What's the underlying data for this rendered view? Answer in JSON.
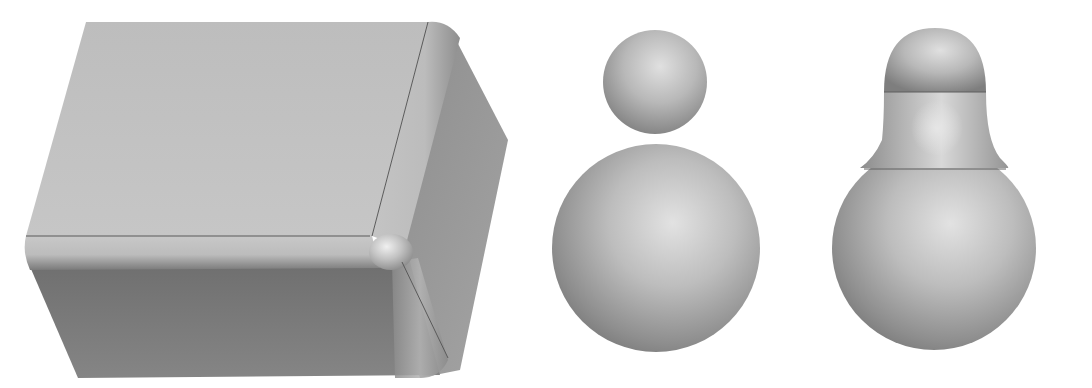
{
  "figure": {
    "background": "#ffffff",
    "panels": [
      {
        "name": "filleted-box",
        "description": "Box with rounded (filleted) edges and a spherical corner blend"
      },
      {
        "name": "two-separate-spheres",
        "description": "Small sphere stacked above a larger sphere, not joined"
      },
      {
        "name": "blended-spheres",
        "description": "Two spheres joined by a smooth blend surface (bulb shape)"
      }
    ],
    "colors": {
      "light_face": "#c4c4c4",
      "mid_face": "#a6a6a6",
      "dark_face": "#7d7d7d",
      "highlight": "#e4e4e4",
      "edge_line": "#555555"
    }
  }
}
